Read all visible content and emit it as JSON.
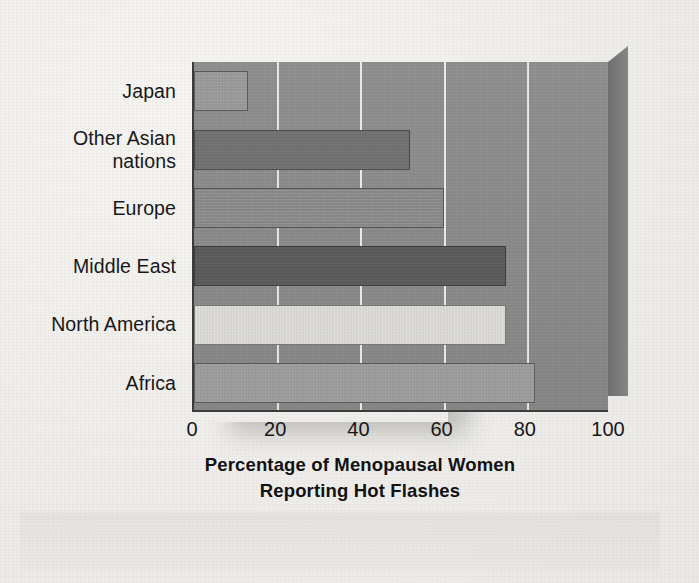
{
  "figure": {
    "background_color": "#efedea",
    "plot_background_color": "#8a8a8a",
    "gridline_color": "#f8f8f6",
    "axis_color": "#3c3c3c",
    "text_color": "#17171a"
  },
  "chart_data": {
    "type": "bar",
    "orientation": "horizontal",
    "title": "",
    "xlabel": "Percentage of Menopausal Women Reporting Hot Flashes",
    "xlabel_lines": [
      "Percentage of Menopausal Women",
      "Reporting Hot Flashes"
    ],
    "ylabel": "",
    "categories": [
      "Japan",
      "Other Asian nations",
      "Europe",
      "Middle East",
      "North America",
      "Africa"
    ],
    "category_label_lines": [
      [
        "Japan"
      ],
      [
        "Other Asian",
        "nations"
      ],
      [
        "Europe"
      ],
      [
        "Middle East"
      ],
      [
        "North America"
      ],
      [
        "Africa"
      ]
    ],
    "values": [
      13,
      52,
      60,
      75,
      75,
      82
    ],
    "bar_colors": [
      "#9a9a9a",
      "#707070",
      "#8a8a8a",
      "#585858",
      "#dedcd8",
      "#9c9c9c"
    ],
    "xlim": [
      0,
      100
    ],
    "xticks": [
      0,
      20,
      40,
      60,
      80,
      100
    ],
    "xtick_labels": [
      "0",
      "20",
      "40",
      "60",
      "80",
      "100"
    ],
    "grid": true,
    "grid_axis": "x",
    "legend": false,
    "style_3d": true,
    "units": "percent"
  }
}
